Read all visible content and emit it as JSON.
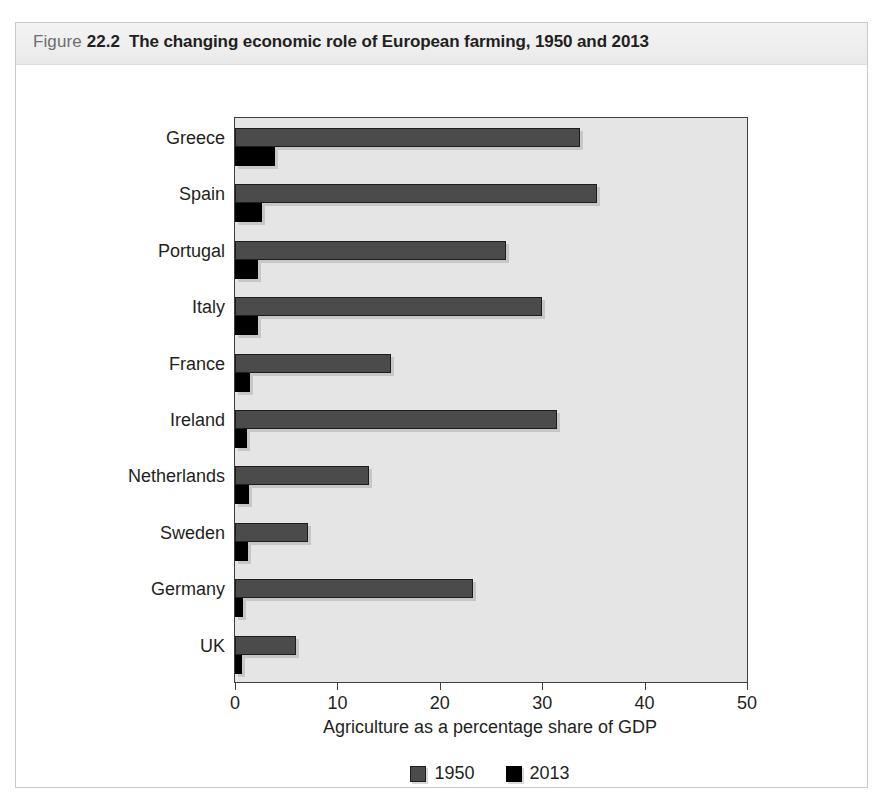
{
  "figure": {
    "label_word": "Figure",
    "number": "22.2",
    "title": "The changing economic role of European farming, 1950 and 2013"
  },
  "chart_data": {
    "type": "bar",
    "orientation": "horizontal",
    "title": "The changing economic role of European farming, 1950 and 2013",
    "xlabel": "Agriculture as a percentage share of GDP",
    "ylabel": "",
    "xlim": [
      0,
      50
    ],
    "xticks": [
      0,
      10,
      20,
      30,
      40,
      50
    ],
    "xtick_labels": [
      "0",
      "10",
      "20",
      "30",
      "40",
      "50"
    ],
    "grid": false,
    "legend_position": "bottom",
    "categories": [
      "Greece",
      "Spain",
      "Portugal",
      "Italy",
      "France",
      "Ireland",
      "Netherlands",
      "Sweden",
      "Germany",
      "UK"
    ],
    "series": [
      {
        "name": "1950",
        "color": "#4b4b4b",
        "values": [
          33.7,
          35.4,
          26.5,
          30.0,
          15.2,
          31.4,
          13.1,
          7.1,
          23.2,
          6.0
        ]
      },
      {
        "name": "2013",
        "color": "#000000",
        "values": [
          3.9,
          2.6,
          2.2,
          2.2,
          1.5,
          1.2,
          1.4,
          1.3,
          0.8,
          0.7
        ]
      }
    ]
  },
  "colors": {
    "series_1950": "#4b4b4b",
    "series_2013": "#000000",
    "plot_background": "#e5e5e5",
    "frame_border": "#c9c9c9",
    "header_band": "#eeeeee"
  }
}
